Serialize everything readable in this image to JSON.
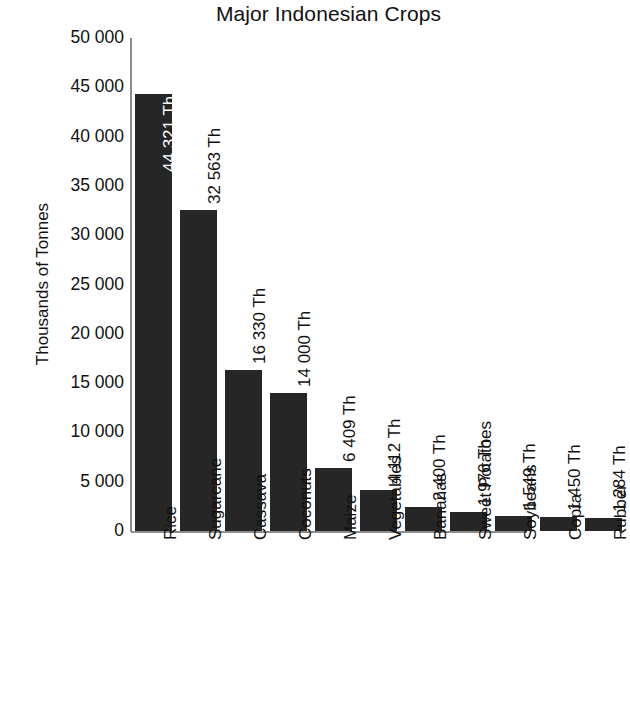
{
  "chart_data": {
    "type": "bar",
    "title": "Major Indonesian Crops",
    "xlabel": "",
    "ylabel": "Thousands of Tonnes",
    "ylim": [
      0,
      50000
    ],
    "grid": false,
    "legend": false,
    "categories": [
      "Rice",
      "Sugarcane",
      "Cassava",
      "Coconuts",
      "Maize",
      "Vegetables",
      "Bananas",
      "Sweet Potatoes",
      "Soybeans",
      "Copra",
      "Rubber"
    ],
    "values": [
      44321,
      32563,
      16330,
      14000,
      6409,
      4112,
      2400,
      1976,
      1549,
      1450,
      1284
    ],
    "value_labels": [
      "44 321 Th",
      "32 563 Th",
      "16 330 Th",
      "14 000 Th",
      "6 409 Th",
      "4 112 Th",
      "2 400 Th",
      "1 976 Th",
      "1 549 Th",
      "1 450 Th",
      "1 284 Th"
    ],
    "value_label_placement": [
      "inside",
      "above",
      "above",
      "above",
      "above",
      "above",
      "above",
      "above",
      "above",
      "above",
      "above"
    ],
    "y_ticks": [
      0,
      5000,
      10000,
      15000,
      20000,
      25000,
      30000,
      35000,
      40000,
      45000,
      50000
    ],
    "y_tick_labels": [
      "0",
      "5 000",
      "10 000",
      "15 000",
      "20 000",
      "25 000",
      "30 000",
      "35 000",
      "40 000",
      "45 000",
      "50 000"
    ],
    "bar_color": "#262626",
    "axis_color": "#8d8d8d",
    "background_color": "#ffffff",
    "text_color": "#111111"
  }
}
